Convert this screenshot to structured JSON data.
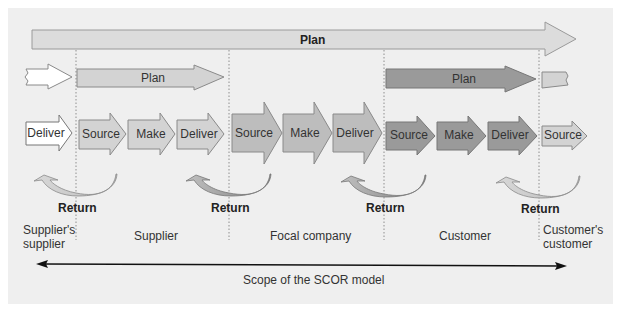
{
  "diagram": {
    "title": "Scope of the SCOR model",
    "colors": {
      "background": "#efefef",
      "plan_top": "#dcdcdc",
      "light": "#d3d3d3",
      "medium": "#bdbdbd",
      "dark": "#9a9a9a",
      "white": "#ffffff",
      "stroke": "#8a8a8a"
    },
    "top_plan": {
      "label": "Plan"
    },
    "plan_arrows": [
      {
        "label": "Plan",
        "zone": "supplier"
      },
      {
        "label": "Plan",
        "zone": "customer"
      }
    ],
    "process_arrows": [
      {
        "label": "Deliver",
        "zone": "suppliers-supplier"
      },
      {
        "label": "Source",
        "zone": "supplier"
      },
      {
        "label": "Make",
        "zone": "supplier"
      },
      {
        "label": "Deliver",
        "zone": "supplier"
      },
      {
        "label": "Source",
        "zone": "focal-company"
      },
      {
        "label": "Make",
        "zone": "focal-company"
      },
      {
        "label": "Deliver",
        "zone": "focal-company"
      },
      {
        "label": "Source",
        "zone": "customer"
      },
      {
        "label": "Make",
        "zone": "customer"
      },
      {
        "label": "Deliver",
        "zone": "customer"
      },
      {
        "label": "Source",
        "zone": "customers-customer"
      }
    ],
    "returns": [
      {
        "label": "Return"
      },
      {
        "label": "Return"
      },
      {
        "label": "Return"
      },
      {
        "label": "Return"
      }
    ],
    "zones": [
      {
        "label_line1": "Supplier's",
        "label_line2": "supplier"
      },
      {
        "label_line1": "Supplier",
        "label_line2": ""
      },
      {
        "label_line1": "Focal company",
        "label_line2": ""
      },
      {
        "label_line1": "Customer",
        "label_line2": ""
      },
      {
        "label_line1": "Customer's",
        "label_line2": "customer"
      }
    ],
    "scope_label": "Scope of the SCOR model"
  }
}
